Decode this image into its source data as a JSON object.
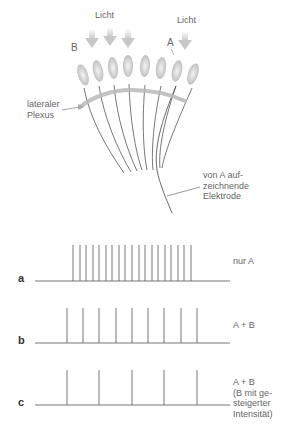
{
  "diagram": {
    "top": {
      "light_label_left": "Licht",
      "light_label_right": "Licht",
      "label_b": "B",
      "label_a": "A",
      "plexus_label_line1": "lateraler",
      "plexus_label_line2": "Plexus",
      "electrode_label_line1": "von A auf-",
      "electrode_label_line2": "zeichnende",
      "electrode_label_line3": "Elektrode",
      "ommatidia_count": 8
    },
    "traces": [
      {
        "letter": "a",
        "caption_lines": [
          "nur A"
        ],
        "spike_count": 19
      },
      {
        "letter": "b",
        "caption_lines": [
          "A + B"
        ],
        "spike_count": 9
      },
      {
        "letter": "c",
        "caption_lines": [
          "A + B",
          "(B mit ge-",
          "steigerter",
          "Intensität)"
        ],
        "spike_count": 5
      }
    ]
  },
  "colors": {
    "line": "#555555",
    "plexus": "#b8b8b8",
    "arrow": "#d0d0d0"
  }
}
